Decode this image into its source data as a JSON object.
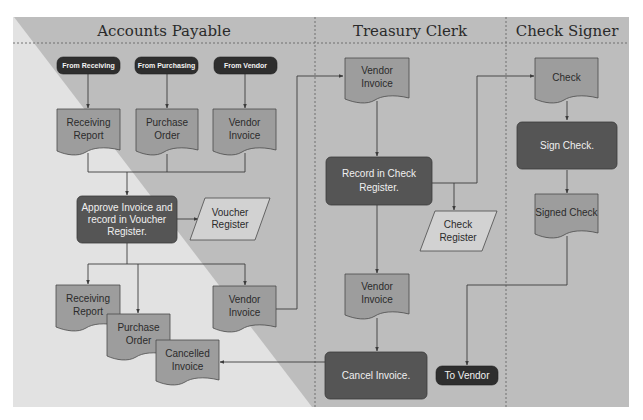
{
  "colors": {
    "background_light": "#e2e2e2",
    "background_dark": "#bdbdbd",
    "document_fill": "#9d9d9d",
    "process_fill": "#555555",
    "terminal_fill": "#2e2e2e",
    "register_fill": "#d2d2d2"
  },
  "lanes": [
    {
      "title": "Accounts Payable"
    },
    {
      "title": "Treasury Clerk"
    },
    {
      "title": "Check Signer"
    }
  ],
  "accounts_payable": {
    "sources": [
      {
        "label": "From Receiving"
      },
      {
        "label": "From Purchasing"
      },
      {
        "label": "From Vendor"
      }
    ],
    "input_docs": [
      {
        "line1": "Receiving",
        "line2": "Report"
      },
      {
        "line1": "Purchase",
        "line2": "Order"
      },
      {
        "line1": "Vendor",
        "line2": "Invoice"
      }
    ],
    "approve_process": {
      "line1": "Approve Invoice and",
      "line2": "record in Voucher",
      "line3": "Register."
    },
    "voucher_register": {
      "line1": "Voucher",
      "line2": "Register"
    },
    "filed_docs": [
      {
        "line1": "Receiving",
        "line2": "Report"
      },
      {
        "line1": "Purchase",
        "line2": "Order"
      },
      {
        "line1": "Cancelled",
        "line2": "Invoice"
      }
    ],
    "outgoing_invoice": {
      "line1": "Vendor",
      "line2": "Invoice"
    }
  },
  "treasury_clerk": {
    "incoming_invoice": {
      "line1": "Vendor",
      "line2": "Invoice"
    },
    "record_process": {
      "line1": "Record in Check",
      "line2": "Register."
    },
    "check_register": {
      "line1": "Check",
      "line2": "Register"
    },
    "returned_invoice": {
      "line1": "Vendor",
      "line2": "Invoice"
    },
    "cancel_process": {
      "label": "Cancel Invoice."
    },
    "to_vendor": {
      "label": "To Vendor"
    }
  },
  "check_signer": {
    "check_doc": {
      "label": "Check"
    },
    "sign_process": {
      "label": "Sign Check."
    },
    "signed_check": {
      "label": "Signed Check"
    }
  }
}
